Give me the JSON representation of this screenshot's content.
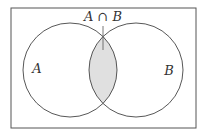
{
  "diagram": {
    "type": "venn",
    "sets": [
      {
        "name": "A",
        "label": "A"
      },
      {
        "name": "B",
        "label": "B"
      }
    ],
    "intersection_label": "A ∩ B",
    "colors": {
      "border": "#555555",
      "circle_stroke": "#444444",
      "intersection_fill": "#e0e0e0",
      "background": "#ffffff"
    }
  }
}
